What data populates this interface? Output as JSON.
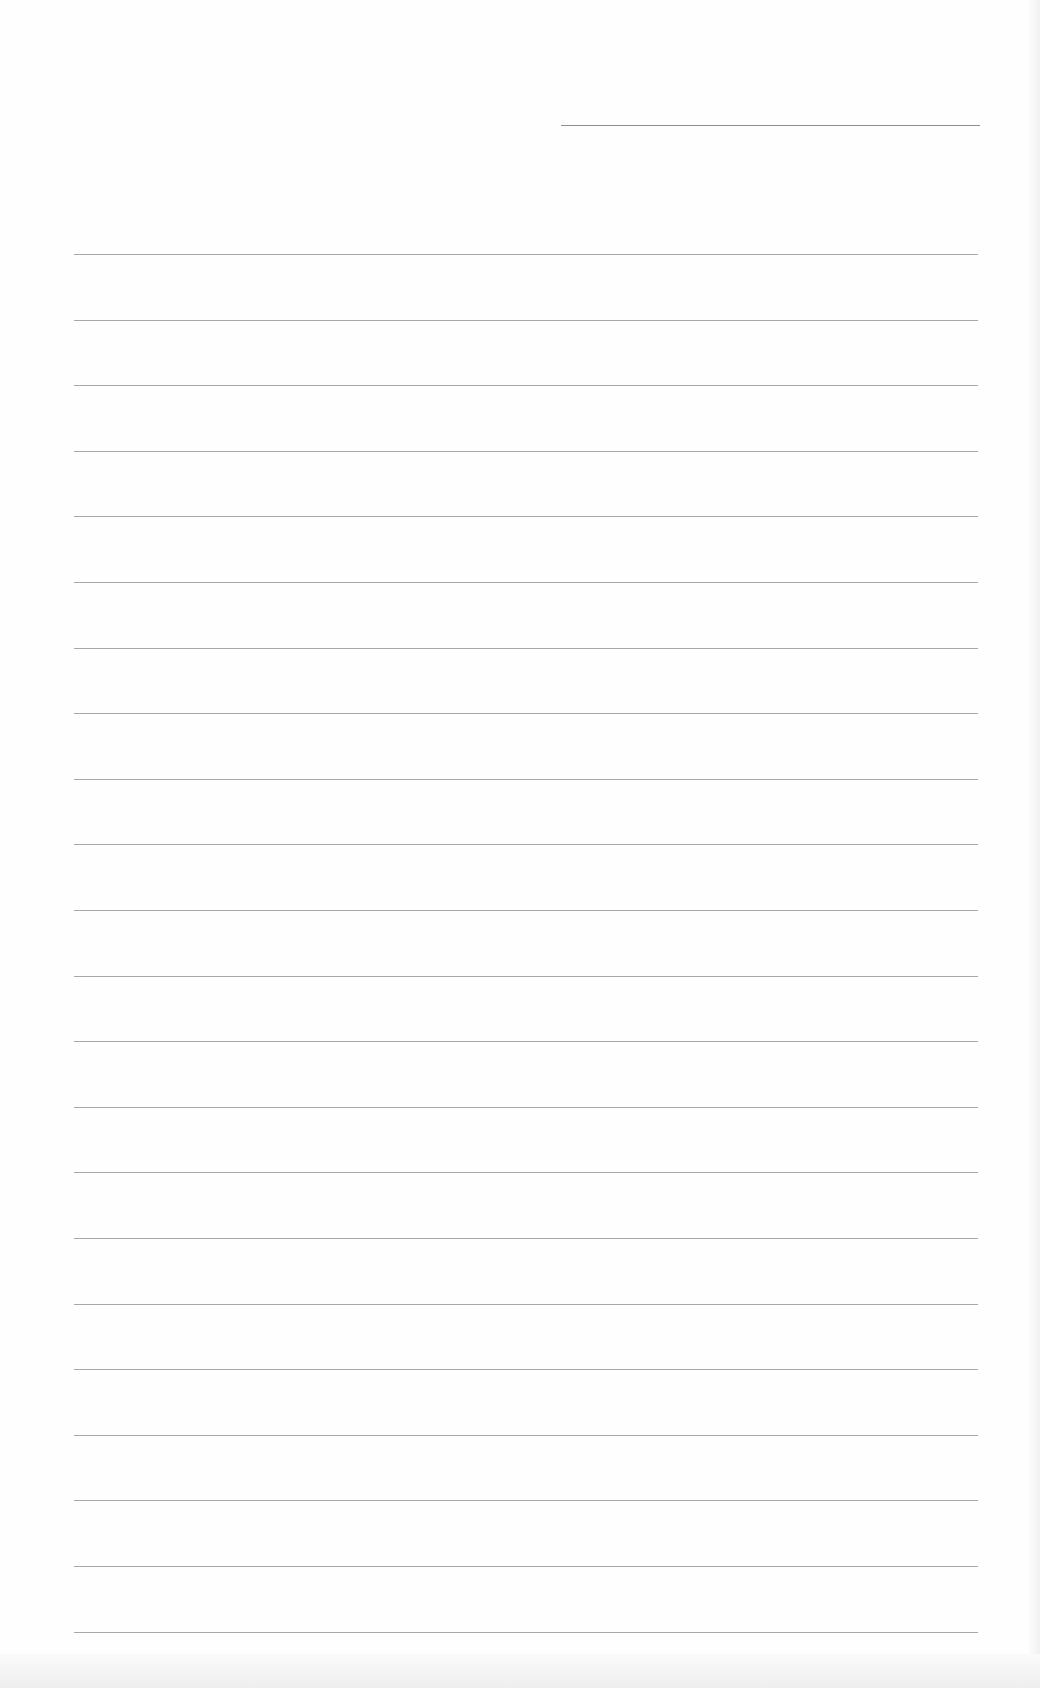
{
  "document": {
    "type": "lined-paper",
    "header_line": {
      "x": 561,
      "y": 125,
      "width": 419
    },
    "rules": {
      "count": 22,
      "start_y": 254,
      "spacing": 65.6,
      "x": 74,
      "width": 904
    },
    "colors": {
      "paper": "#fefefe",
      "rule": "#9a9a9a"
    }
  }
}
